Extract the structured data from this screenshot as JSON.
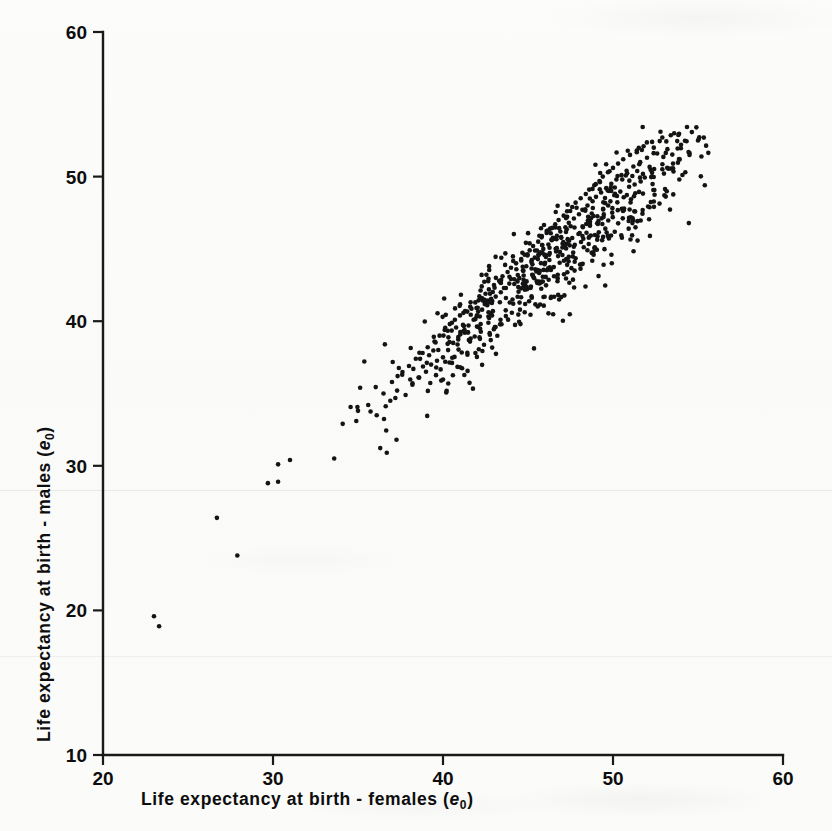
{
  "figure": {
    "background_color": "#fbfbfa",
    "ink_color": "#141414"
  },
  "chart_data": {
    "type": "scatter",
    "title": "",
    "subtitle": "",
    "xlabel": "Life expectancy at birth - females (e₀)",
    "ylabel": "Life expectancy at birth - males (e₀)",
    "xlabel_parts": {
      "main": "Life  expectancy  at  birth - females",
      "symbol": "e",
      "subscript": "0"
    },
    "ylabel_parts": {
      "main": "Life  expectancy  at  birth - males",
      "symbol": "e",
      "subscript": "0"
    },
    "xlim": [
      20,
      60
    ],
    "ylim": [
      10,
      60
    ],
    "xticks": [
      20,
      30,
      40,
      50,
      60
    ],
    "yticks": [
      10,
      20,
      30,
      40,
      50,
      60
    ],
    "xtick_labels": [
      "20",
      "30",
      "40",
      "50",
      "60"
    ],
    "ytick_labels": [
      "10",
      "20",
      "30",
      "40",
      "50",
      "60"
    ],
    "grid": false,
    "legend": null,
    "tick_direction": "out",
    "marker": "dot",
    "marker_size": 2.3,
    "n_points": 706,
    "correlation_note": "strong positive linear relationship; males' life expectancy slightly below females'",
    "points": [
      [
        23.0,
        19.6
      ],
      [
        23.3,
        18.9
      ],
      [
        27.9,
        23.8
      ],
      [
        26.7,
        26.4
      ],
      [
        29.7,
        28.8
      ],
      [
        30.3,
        28.9
      ],
      [
        30.3,
        30.1
      ],
      [
        31.0,
        30.4
      ],
      [
        33.6,
        30.5
      ],
      [
        34.1,
        32.9
      ],
      [
        34.9,
        33.1
      ],
      [
        35.0,
        33.8
      ],
      [
        35.6,
        34.2
      ],
      [
        36.1,
        33.5
      ],
      [
        36.5,
        35.0
      ],
      [
        36.9,
        34.5
      ],
      [
        37.0,
        35.8
      ],
      [
        37.3,
        35.2
      ],
      [
        37.6,
        36.3
      ],
      [
        37.8,
        34.9
      ],
      [
        38.0,
        36.9
      ],
      [
        38.2,
        35.6
      ],
      [
        38.4,
        37.4
      ],
      [
        38.6,
        36.1
      ],
      [
        38.8,
        37.8
      ],
      [
        39.0,
        36.5
      ],
      [
        39.1,
        38.2
      ],
      [
        39.3,
        37.0
      ],
      [
        39.5,
        38.6
      ],
      [
        39.6,
        36.8
      ],
      [
        39.8,
        39.0
      ],
      [
        40.0,
        37.5
      ],
      [
        40.1,
        39.4
      ],
      [
        40.3,
        38.0
      ],
      [
        40.4,
        39.8
      ],
      [
        40.6,
        38.5
      ],
      [
        40.7,
        40.1
      ],
      [
        40.9,
        38.9
      ],
      [
        41.0,
        40.4
      ],
      [
        41.2,
        39.3
      ],
      [
        41.3,
        40.7
      ],
      [
        41.5,
        39.7
      ],
      [
        41.6,
        41.0
      ],
      [
        41.8,
        40.1
      ],
      [
        41.9,
        41.3
      ],
      [
        42.0,
        40.4
      ],
      [
        42.2,
        41.6
      ],
      [
        42.3,
        40.8
      ],
      [
        42.5,
        41.9
      ],
      [
        42.6,
        41.1
      ],
      [
        42.7,
        42.2
      ],
      [
        42.9,
        41.4
      ],
      [
        43.0,
        42.5
      ],
      [
        43.1,
        41.7
      ],
      [
        43.3,
        42.8
      ],
      [
        43.4,
        42.0
      ],
      [
        43.5,
        43.1
      ],
      [
        43.7,
        42.3
      ],
      [
        43.8,
        43.4
      ],
      [
        43.9,
        42.6
      ],
      [
        44.0,
        43.7
      ],
      [
        44.2,
        42.9
      ],
      [
        44.3,
        44.0
      ],
      [
        44.4,
        43.2
      ],
      [
        44.6,
        44.3
      ],
      [
        44.7,
        43.5
      ],
      [
        44.8,
        44.6
      ],
      [
        44.9,
        43.8
      ],
      [
        45.1,
        44.9
      ],
      [
        45.2,
        44.1
      ],
      [
        45.3,
        45.2
      ],
      [
        45.4,
        44.4
      ],
      [
        45.6,
        45.5
      ],
      [
        45.7,
        44.7
      ],
      [
        45.8,
        45.8
      ],
      [
        45.9,
        45.0
      ],
      [
        46.1,
        46.1
      ],
      [
        46.2,
        45.3
      ],
      [
        46.3,
        46.4
      ],
      [
        46.4,
        45.6
      ],
      [
        46.6,
        46.7
      ],
      [
        46.7,
        45.9
      ],
      [
        46.8,
        47.0
      ],
      [
        46.9,
        46.2
      ],
      [
        47.1,
        47.3
      ],
      [
        47.2,
        46.5
      ],
      [
        47.3,
        47.6
      ],
      [
        47.4,
        46.8
      ],
      [
        47.6,
        47.9
      ],
      [
        47.7,
        47.1
      ],
      [
        47.8,
        48.2
      ],
      [
        48.0,
        47.4
      ],
      [
        48.1,
        48.5
      ],
      [
        48.2,
        47.7
      ],
      [
        48.4,
        48.8
      ],
      [
        48.5,
        48.0
      ],
      [
        48.6,
        49.1
      ],
      [
        48.8,
        48.3
      ],
      [
        48.9,
        49.4
      ],
      [
        49.0,
        48.6
      ],
      [
        49.2,
        49.7
      ],
      [
        49.3,
        48.9
      ],
      [
        49.4,
        50.0
      ],
      [
        49.6,
        49.2
      ],
      [
        49.7,
        50.3
      ],
      [
        49.9,
        49.5
      ],
      [
        50.0,
        50.6
      ],
      [
        50.2,
        49.8
      ],
      [
        50.3,
        50.9
      ],
      [
        50.5,
        50.1
      ],
      [
        50.6,
        51.2
      ],
      [
        50.8,
        50.4
      ],
      [
        51.0,
        51.5
      ],
      [
        51.2,
        50.7
      ],
      [
        51.4,
        51.8
      ],
      [
        51.6,
        51.0
      ],
      [
        51.8,
        52.1
      ],
      [
        52.0,
        51.3
      ],
      [
        52.3,
        52.4
      ],
      [
        52.6,
        51.6
      ],
      [
        52.9,
        52.7
      ],
      [
        53.2,
        51.9
      ],
      [
        53.6,
        53.0
      ],
      [
        54.0,
        52.2
      ],
      [
        54.5,
        51.5
      ],
      [
        55.0,
        52.5
      ],
      [
        55.4,
        49.4
      ],
      [
        53.9,
        49.8
      ]
    ],
    "cluster_definition": {
      "description": "main cloud generated along the diagonal with scatter; deterministic pseudo-random fill reproduces the dense band",
      "x_center": 46.5,
      "x_spread": 4.6,
      "slope": 0.95,
      "intercept": 0.0,
      "residual_spread": 1.9,
      "count": 580,
      "x_min": 33.0,
      "x_max": 56.0,
      "y_min": 30.0,
      "y_max": 53.5
    }
  }
}
